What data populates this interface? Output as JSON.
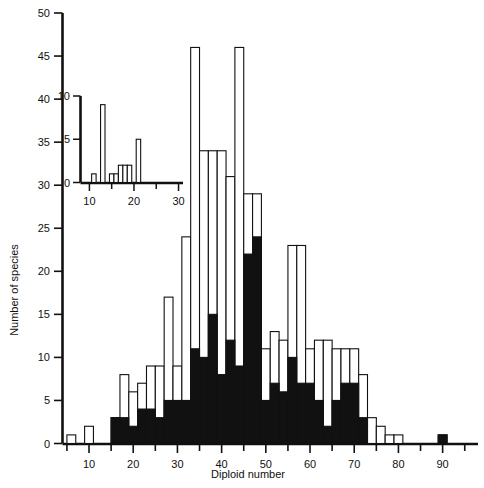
{
  "chart_data": {
    "type": "bar",
    "title": "",
    "xlabel": "Diploid number",
    "ylabel": "Number of species",
    "xlim": [
      4,
      98
    ],
    "ylim": [
      0,
      50
    ],
    "bin_width": 2,
    "grid": false,
    "legend": [],
    "xticks": [
      10,
      20,
      30,
      40,
      50,
      60,
      70,
      80,
      90
    ],
    "yticks": [
      0,
      5,
      10,
      15,
      20,
      25,
      30,
      35,
      40,
      45,
      50
    ],
    "xtick_minor_step": 5,
    "stacked": true,
    "categories": [
      6,
      8,
      10,
      12,
      14,
      16,
      18,
      20,
      22,
      24,
      26,
      28,
      30,
      32,
      34,
      36,
      38,
      40,
      42,
      44,
      46,
      48,
      50,
      52,
      54,
      56,
      58,
      60,
      62,
      64,
      66,
      68,
      70,
      72,
      74,
      76,
      78,
      80,
      82,
      84,
      86,
      88,
      90,
      92
    ],
    "series": [
      {
        "name": "filled",
        "color": "#111111",
        "values": [
          0,
          0,
          0,
          0,
          0,
          3,
          3,
          2,
          4,
          4,
          3,
          5,
          5,
          5,
          11,
          10,
          15,
          8,
          12,
          9,
          22,
          24,
          5,
          7,
          6,
          10,
          7,
          7,
          5,
          2,
          5,
          7,
          7,
          3,
          0,
          0,
          0,
          0,
          0,
          0,
          0,
          0,
          1,
          0
        ]
      },
      {
        "name": "open",
        "color": "#ffffff",
        "values": [
          1,
          0,
          2,
          0,
          0,
          0,
          5,
          4,
          3,
          5,
          6,
          12,
          4,
          19,
          35,
          24,
          19,
          26,
          19,
          37,
          7,
          5,
          6,
          6,
          6,
          13,
          16,
          4,
          7,
          10,
          6,
          4,
          4,
          5,
          3,
          2,
          1,
          1,
          0,
          0,
          0,
          0,
          0,
          0
        ]
      }
    ],
    "totals": [
      1,
      0,
      2,
      0,
      0,
      3,
      8,
      6,
      7,
      9,
      9,
      17,
      9,
      24,
      46,
      34,
      34,
      34,
      31,
      46,
      29,
      29,
      11,
      13,
      12,
      23,
      23,
      11,
      12,
      12,
      11,
      11,
      11,
      8,
      3,
      2,
      1,
      1,
      0,
      0,
      0,
      0,
      1,
      0
    ]
  },
  "inset": {
    "xlabel": "",
    "ylabel": "",
    "xlim": [
      8,
      31
    ],
    "ylim": [
      0,
      10
    ],
    "xticks": [
      10,
      20,
      30
    ],
    "yticks": [
      0,
      5,
      10
    ],
    "type": "bar",
    "bin_width": 1,
    "categories": [
      11,
      12,
      13,
      14,
      15,
      16,
      17,
      18,
      19,
      20,
      21,
      22
    ],
    "values": [
      1,
      0,
      9,
      0,
      1,
      1,
      2,
      2,
      2,
      0,
      5,
      0
    ]
  },
  "ticklabels": {
    "x": [
      "10",
      "20",
      "30",
      "40",
      "50",
      "60",
      "70",
      "80",
      "90"
    ],
    "y": [
      "0",
      "5",
      "10",
      "15",
      "20",
      "25",
      "30",
      "35",
      "40",
      "45",
      "50"
    ],
    "inset_x": [
      "10",
      "20",
      "30"
    ],
    "inset_y": [
      "0",
      "5",
      "10"
    ]
  },
  "labels": {
    "x_axis_title": "Diploid number",
    "y_axis_title": "Number of species"
  },
  "colors": {
    "ink": "#111111",
    "paper": "#ffffff"
  }
}
